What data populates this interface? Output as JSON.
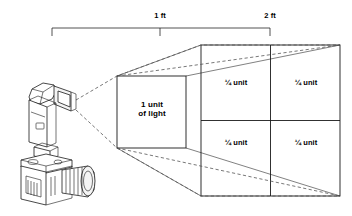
{
  "diagram": {
    "colors": {
      "background": "#ffffff",
      "stroke": "#1a1a1a",
      "ray_dashed": "#4d4d4d",
      "text": "#000000",
      "device_fill": "#ffffff",
      "device_shade": "#f2f2f2"
    },
    "dimension_scale": {
      "label": "distance-scale-bracket",
      "ticks": [
        {
          "name": "origin-tick",
          "x": 52,
          "label": ""
        },
        {
          "name": "one-foot-tick",
          "x": 160,
          "label": "1 ft"
        },
        {
          "name": "two-foot-tick",
          "x": 270,
          "label": "2 ft"
        }
      ],
      "marks": [
        {
          "id": "one_ft",
          "text": "1 ft"
        },
        {
          "id": "two_ft",
          "text": "2 ft"
        }
      ]
    },
    "near_plane": {
      "name": "one-unit-square",
      "distance": "1 ft",
      "label_line1": "1 unit",
      "label_line2": "of light",
      "area_units": 1,
      "bounds": {
        "x": 117,
        "y": 76,
        "w": 69,
        "h": 72
      }
    },
    "far_plane": {
      "name": "four-quarter-unit-square",
      "distance": "2 ft",
      "area_units": 4,
      "bounds": {
        "x": 201,
        "y": 45,
        "w": 139,
        "h": 151
      },
      "cells": [
        {
          "id": "top_left",
          "text": "¼ unit"
        },
        {
          "id": "top_right",
          "text": "¼ unit"
        },
        {
          "id": "bottom_left",
          "text": "¼ unit"
        },
        {
          "id": "bottom_right",
          "text": "¼ unit"
        }
      ]
    },
    "light_source": {
      "name": "camera-flash-unit",
      "origin": {
        "x": 76,
        "y": 104
      },
      "parts": [
        "flash-head",
        "flash-body",
        "hot-shoe",
        "camera-body",
        "camera-lens"
      ]
    },
    "rays": {
      "name": "light-spread-rays",
      "style": "dashed",
      "count": 2
    }
  }
}
